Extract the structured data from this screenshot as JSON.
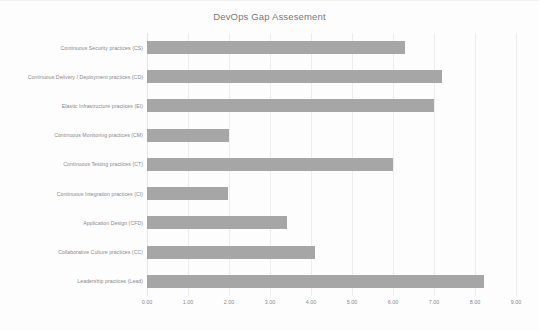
{
  "chart_data": {
    "type": "bar",
    "orientation": "horizontal",
    "title": "DevOps Gap Assesement",
    "xlabel": "",
    "ylabel": "",
    "xlim": [
      0,
      9
    ],
    "ylim": null,
    "grid": true,
    "legend": false,
    "bar_color": "#a6a6a6",
    "categories": [
      "Continuous Security practices (CS)",
      "Continuous Delivery / Deployment practices (CD)",
      "Elastic Infrastructure practices (EI)",
      "Continuous Monitoring practices (CM)",
      "Continuous Testing practices (CT)",
      "Continuous Integration practices (CI)",
      "Application Design (CFD)",
      "Collaborative Culture practices (CC)",
      "Leadership practices (Lead)"
    ],
    "values": [
      6.3,
      7.2,
      7.0,
      2.0,
      6.0,
      1.98,
      3.42,
      4.1,
      8.22
    ],
    "xticks": [
      0,
      1,
      2,
      3,
      4,
      5,
      6,
      7,
      8,
      9
    ],
    "xticklabels": [
      "0.00",
      "1.00",
      "2.00",
      "3.00",
      "4.00",
      "5.00",
      "6.00",
      "7.00",
      "8.00",
      "9.00"
    ]
  },
  "chart": {
    "title": "DevOps Gap Assesement"
  }
}
